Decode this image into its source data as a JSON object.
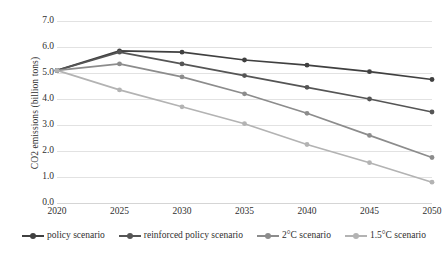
{
  "chart_data": {
    "type": "line",
    "title": "",
    "xlabel": "",
    "ylabel": "CO2 emissions (billion tons)",
    "x": [
      2020,
      2025,
      2030,
      2035,
      2040,
      2045,
      2050
    ],
    "xtick_labels": [
      "2020",
      "2025",
      "2030",
      "2035",
      "2040",
      "2045",
      "2050"
    ],
    "ytick_labels": [
      "0.0",
      "1.0",
      "2.0",
      "3.0",
      "4.0",
      "5.0",
      "6.0",
      "7.0"
    ],
    "ylim": [
      0.0,
      7.0
    ],
    "ytick_step": 1.0,
    "grid": true,
    "legend_position": "bottom",
    "markers": "circle",
    "series": [
      {
        "name": "policy scenario",
        "color": "#404040",
        "values": [
          5.1,
          5.85,
          5.8,
          5.5,
          5.3,
          5.05,
          4.75
        ]
      },
      {
        "name": "reinforced policy scenario",
        "color": "#555555",
        "values": [
          5.1,
          5.8,
          5.35,
          4.9,
          4.45,
          4.0,
          3.5
        ]
      },
      {
        "name": "2°C scenario",
        "color": "#8c8c8c",
        "values": [
          5.1,
          5.35,
          4.85,
          4.2,
          3.45,
          2.6,
          1.75
        ]
      },
      {
        "name": "1.5°C scenario",
        "color": "#b3b3b3",
        "values": [
          5.1,
          4.35,
          3.7,
          3.05,
          2.25,
          1.55,
          0.8
        ]
      }
    ]
  }
}
